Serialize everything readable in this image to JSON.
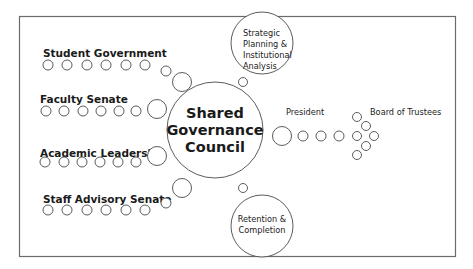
{
  "diagram": {
    "type": "hub-and-spoke",
    "center": {
      "lines": [
        "Shared",
        "Governance",
        "Council"
      ]
    },
    "groups": [
      {
        "id": "student-government",
        "label": "Student Government"
      },
      {
        "id": "faculty-senate",
        "label": "Faculty Senate"
      },
      {
        "id": "academic-leadership",
        "label": "Academic Leadership"
      },
      {
        "id": "staff-advisory-senate",
        "label": "Staff Advisory Senate"
      }
    ],
    "satellites": [
      {
        "id": "strategic-planning",
        "lines": [
          "Strategic",
          "Planning &",
          "Institutional",
          "Analysis"
        ]
      },
      {
        "id": "retention-completion",
        "lines": [
          "Retention &",
          "Completion"
        ]
      }
    ],
    "outputs": [
      {
        "id": "president",
        "label": "President"
      },
      {
        "id": "board-of-trustees",
        "label": "Board of Trustees"
      }
    ],
    "colors": {
      "stroke": "#4a4a4a",
      "frame": "#6b6b6b",
      "text": "#1a1a1a",
      "background": "#ffffff"
    }
  }
}
